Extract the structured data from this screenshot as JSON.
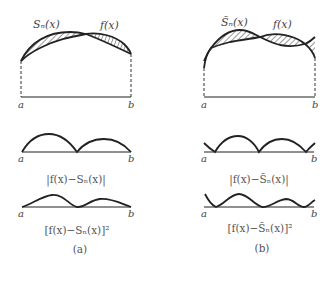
{
  "panels": [
    {
      "id": "a",
      "caption": "(a)",
      "top": {
        "curve1_label": "Sₙ(x)",
        "curve2_label": "f(x)",
        "a_label": "a",
        "b_label": "b"
      },
      "middle": {
        "a_label": "a",
        "b_label": "b",
        "expr": "|f(x)−Sₙ(x)|"
      },
      "bottom": {
        "a_label": "a",
        "b_label": "b",
        "expr": "[f(x)−Sₙ(x)]²"
      }
    },
    {
      "id": "b",
      "caption": "(b)",
      "top": {
        "curve1_label": "S̃ₙ(x)",
        "curve2_label": "f(x)",
        "a_label": "a",
        "b_label": "b"
      },
      "middle": {
        "a_label": "a",
        "b_label": "b",
        "expr": "|f(x)−S̃ₙ(x)|"
      },
      "bottom": {
        "a_label": "a",
        "b_label": "b",
        "expr": "[f(x)−S̃ₙ(x)]²"
      }
    }
  ],
  "colors": {
    "stroke": "#222222",
    "hatch": "#333333",
    "text": "#555555"
  }
}
